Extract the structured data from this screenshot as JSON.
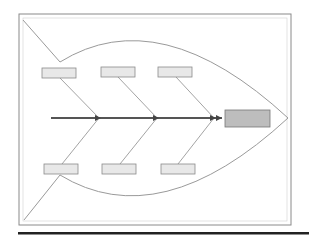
{
  "diagram": {
    "type": "fishbone",
    "title": "",
    "colors": {
      "frame": "#8a8a8a",
      "outline": "#9a9a9a",
      "spine": "#555555",
      "cause_box_fill": "#e8e8e8",
      "cause_box_stroke": "#8a8a8a",
      "effect_box_fill": "#bdbdbd",
      "effect_box_stroke": "#777777",
      "bottom_rule": "#222222"
    },
    "effect": {
      "label": ""
    },
    "causes_top": [
      {
        "label": ""
      },
      {
        "label": ""
      },
      {
        "label": ""
      }
    ],
    "causes_bottom": [
      {
        "label": ""
      },
      {
        "label": ""
      },
      {
        "label": ""
      }
    ]
  }
}
